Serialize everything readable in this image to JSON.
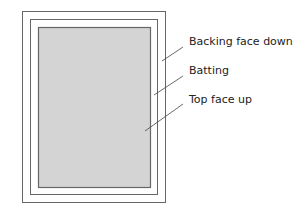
{
  "diagram": {
    "colors": {
      "line": "#666666",
      "top_fill": "#d4d4d4",
      "background": "#ffffff",
      "text": "#222222"
    },
    "layers": [
      {
        "id": "backing",
        "label": "Backing face down",
        "rect": [
          22,
          11,
          144,
          192
        ]
      },
      {
        "id": "batting",
        "label": "Batting",
        "rect": [
          30,
          19,
          128,
          176
        ]
      },
      {
        "id": "top",
        "label": "Top face up",
        "rect": [
          38,
          27,
          113,
          161
        ]
      }
    ],
    "labels": {
      "backing": "Backing face down",
      "batting": "Batting",
      "top": "Top face up"
    }
  }
}
